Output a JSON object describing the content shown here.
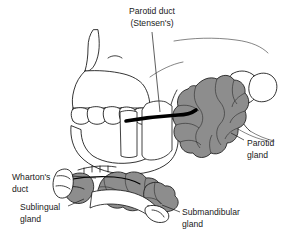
{
  "figure": {
    "kind": "anatomical-illustration",
    "background_color": "#ffffff",
    "line_color": "#111111",
    "gland_fill_color": "#8d8d8d",
    "duct_color": "#000000"
  },
  "labels": {
    "parotid_duct": {
      "line1": "Parotid duct",
      "line2": "(Stensen's)"
    },
    "parotid_gland": {
      "line1": "Parotid",
      "line2": "gland"
    },
    "whartons_duct": {
      "line1": "Wharton's",
      "line2": "duct"
    },
    "sublingual_gland": {
      "line1": "Sublingual",
      "line2": "gland"
    },
    "submandibular_gland": {
      "line1": "Submandibular",
      "line2": "gland"
    }
  },
  "structures": {
    "skull": "skull-outline",
    "maxillary_teeth": "upper-teeth-row",
    "mandible": "mandible-outline",
    "masseter": "hatched-muscle",
    "parotid_gland_mass": "lobulated-gray-gland",
    "submandibular_gland_mass": "lobulated-gray-gland",
    "sublingual_gland_mass": "stippled-gray-gland",
    "parotid_duct_line": "thick-black-duct",
    "whartons_duct_line": "thin-black-duct"
  }
}
